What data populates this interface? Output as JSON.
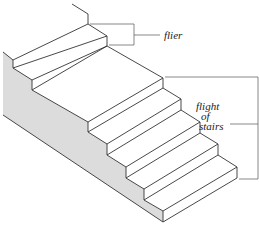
{
  "diagram": {
    "labels": {
      "flier": "flier",
      "flight_line1": "flight",
      "flight_line2": "of",
      "flight_line3": "stairs"
    },
    "colors": {
      "line": "#333333",
      "side_fill": "#dcdcdc",
      "background": "#ffffff"
    }
  }
}
